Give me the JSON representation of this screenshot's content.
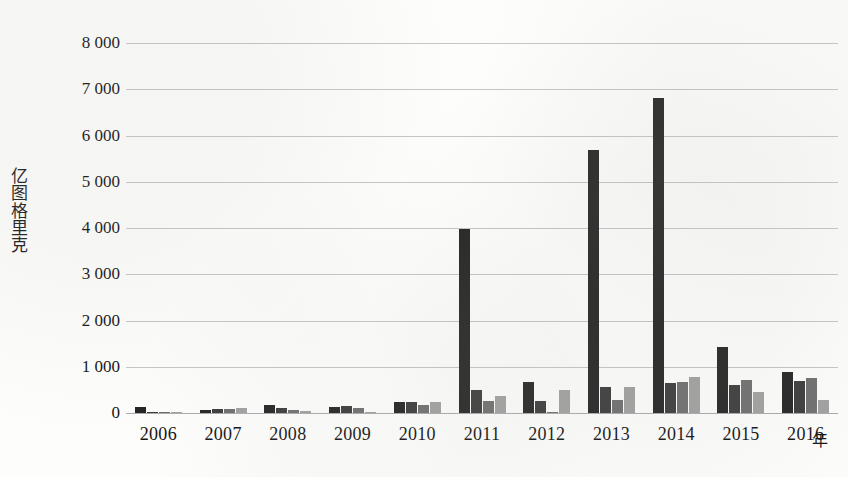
{
  "chart_data": {
    "type": "bar",
    "title": "",
    "subtitle": "",
    "xlabel": "年",
    "ylabel": "亿图格里克",
    "ylabel_chars": [
      "亿",
      "图",
      "格",
      "里",
      "克"
    ],
    "categories": [
      "2006",
      "2007",
      "2008",
      "2009",
      "2010",
      "2011",
      "2012",
      "2013",
      "2014",
      "2015",
      "2016"
    ],
    "ylim": [
      0,
      8000
    ],
    "ytick_labels": [
      "0",
      "1 000",
      "2 000",
      "3 000",
      "4 000",
      "5 000",
      "6 000",
      "7 000",
      "8 000"
    ],
    "ytick_values": [
      0,
      1000,
      2000,
      3000,
      4000,
      5000,
      6000,
      7000,
      8000
    ],
    "grid": true,
    "legend": "none",
    "series": [
      {
        "name": "series-1",
        "color": "#242424",
        "values": [
          130,
          70,
          180,
          140,
          230,
          3980,
          670,
          5680,
          6810,
          1430,
          880
        ]
      },
      {
        "name": "series-2",
        "color": "#3b3b3b",
        "values": [
          20,
          80,
          110,
          150,
          240,
          490,
          250,
          570,
          640,
          600,
          700
        ]
      },
      {
        "name": "series-3",
        "color": "#6e6e6e",
        "values": [
          10,
          90,
          60,
          100,
          170,
          250,
          10,
          290,
          670,
          720,
          760
        ]
      },
      {
        "name": "series-4",
        "color": "#a0a0a0",
        "values": [
          5,
          110,
          50,
          30,
          230,
          360,
          490,
          570,
          780,
          450,
          280
        ]
      }
    ]
  }
}
